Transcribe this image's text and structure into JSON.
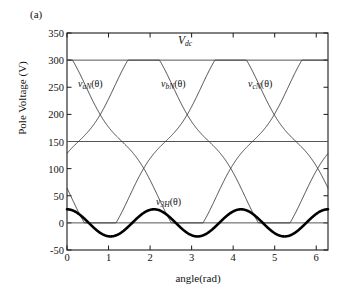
{
  "panel": {
    "tag": "(a)"
  },
  "axes": {
    "ylabel": "Pole Voltage (V)",
    "xlabel": "angle(rad)",
    "yticks": [
      "-50",
      "0",
      "50",
      "100",
      "150",
      "200",
      "250",
      "300",
      "350"
    ],
    "ytick_values": [
      -50,
      0,
      50,
      100,
      150,
      200,
      250,
      300,
      350
    ],
    "xticks": [
      "0",
      "1",
      "2",
      "3",
      "4",
      "5",
      "6"
    ],
    "xtick_values": [
      0,
      1,
      2,
      3,
      4,
      5,
      6
    ],
    "xlim": [
      0,
      6.2832
    ],
    "ylim": [
      -50,
      350
    ]
  },
  "annotations": {
    "vdc": "V",
    "vdc_sub": "dc",
    "va": "v",
    "va_sub": "aN",
    "va_arg": "(θ)",
    "vb": "v",
    "vb_sub": "bN",
    "vb_arg": "(θ)",
    "vc": "v",
    "vc_sub": "cN",
    "vc_arg": "(θ)",
    "v3h": "v",
    "v3h_sub": "3H",
    "v3h_arg": "(θ)"
  },
  "colors": {
    "axis": "#1a1a1a",
    "thin_curve": "#333333",
    "thick_curve": "#000000",
    "gridline": "#555555",
    "background": "#ffffff"
  },
  "chart_data": {
    "type": "line",
    "title": "",
    "xlabel": "angle(rad)",
    "ylabel": "Pole Voltage (V)",
    "xlim": [
      0,
      6.2832
    ],
    "ylim": [
      -50,
      350
    ],
    "grid": false,
    "legend": "inline-annotations",
    "reference_lines": [
      {
        "name": "Vdc",
        "y": 300,
        "label": "V_dc"
      },
      {
        "name": "mid",
        "y": 150,
        "label": ""
      },
      {
        "name": "zero",
        "y": 0,
        "label": ""
      }
    ],
    "series": [
      {
        "name": "v_aN(theta)",
        "style": "thin",
        "description": "Phase-a pole voltage: sinusoid of amplitude 150 V about 150 V offset plus third-harmonic injection, flat-topped/clipped at 300 V (Vdc) near the peak.",
        "x": [
          0.0,
          0.26,
          0.52,
          0.79,
          1.05,
          1.31,
          1.57,
          1.83,
          2.09,
          2.36,
          2.62,
          2.88,
          3.14,
          3.4,
          3.67,
          3.93,
          4.19,
          4.45,
          4.71,
          4.97,
          5.24,
          5.5,
          5.76,
          6.02,
          6.28
        ],
        "y": [
          42,
          18,
          2,
          0,
          8,
          28,
          56,
          92,
          132,
          175,
          216,
          254,
          285,
          300,
          300,
          300,
          300,
          300,
          300,
          285,
          254,
          216,
          175,
          132,
          42
        ]
      },
      {
        "name": "v_bN(theta)",
        "style": "thin",
        "description": "Phase-b pole voltage, shifted +2pi/3 rad from phase a, flat-topped at 300 V.",
        "x": [
          0.0,
          0.26,
          0.52,
          0.79,
          1.05,
          1.31,
          1.57,
          1.83,
          2.09,
          2.36,
          2.62,
          2.88,
          3.14,
          3.4,
          3.67,
          3.93,
          4.19,
          4.45,
          4.71,
          4.97,
          5.24,
          5.5,
          5.76,
          6.02,
          6.28
        ],
        "y": [
          300,
          300,
          300,
          300,
          285,
          254,
          216,
          175,
          132,
          92,
          56,
          28,
          8,
          0,
          2,
          18,
          42,
          78,
          125,
          175,
          216,
          254,
          285,
          300,
          300
        ]
      },
      {
        "name": "v_cN(theta)",
        "style": "thin",
        "description": "Phase-c pole voltage, shifted -2pi/3 rad from phase a, flat-topped at 300 V.",
        "x": [
          0.0,
          0.26,
          0.52,
          0.79,
          1.05,
          1.31,
          1.57,
          1.83,
          2.09,
          2.36,
          2.62,
          2.88,
          3.14,
          3.4,
          3.67,
          3.93,
          4.19,
          4.45,
          4.71,
          4.97,
          5.24,
          5.5,
          5.76,
          6.02,
          6.28
        ],
        "y": [
          285,
          254,
          216,
          175,
          132,
          92,
          56,
          28,
          8,
          0,
          2,
          18,
          42,
          78,
          125,
          175,
          216,
          254,
          285,
          300,
          300,
          300,
          300,
          300,
          285
        ]
      },
      {
        "name": "v_3H(theta)",
        "style": "thick",
        "description": "Third-harmonic (triplen) common-mode component, 3 cycles over 2pi, amplitude about 25 V centred on 0 V.",
        "amplitude": 25,
        "frequency_cycles_per_2pi": 3,
        "offset": 0,
        "x": [
          0.0,
          0.26,
          0.52,
          0.79,
          1.05,
          1.31,
          1.57,
          1.83,
          2.09,
          2.36,
          2.62,
          2.88,
          3.14,
          3.4,
          3.67,
          3.93,
          4.19,
          4.45,
          4.71,
          4.97,
          5.24,
          5.5,
          5.76,
          6.02,
          6.28
        ],
        "y": [
          25,
          12,
          -12,
          -25,
          -12,
          12,
          25,
          12,
          -12,
          -25,
          -12,
          12,
          25,
          12,
          -12,
          -25,
          -12,
          12,
          25,
          12,
          -12,
          -25,
          -12,
          12,
          25
        ]
      }
    ]
  }
}
